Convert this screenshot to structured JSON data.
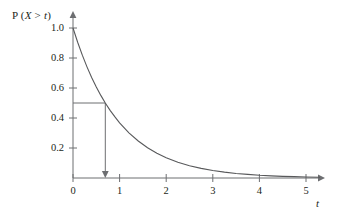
{
  "figure": {
    "background_color": "#ffffff",
    "line_color": "#6d6e71",
    "curve_color": "#58595b",
    "text_color": "#231f20"
  },
  "chart_data": {
    "type": "line",
    "title": "",
    "subtitle": "",
    "xlabel": "t",
    "ylabel": "P (X > t)",
    "xlim": [
      0,
      5.6
    ],
    "ylim": [
      0,
      1.08
    ],
    "grid": false,
    "legend": null,
    "x_ticks": [
      "0",
      "1",
      "2",
      "3",
      "4",
      "5"
    ],
    "x_tick_values": [
      0,
      1,
      2,
      3,
      4,
      5
    ],
    "y_ticks": [
      "0.2",
      "0.4",
      "0.6",
      "0.8",
      "1.0"
    ],
    "y_tick_values": [
      0.2,
      0.4,
      0.6,
      0.8,
      1.0
    ],
    "series": [
      {
        "name": "P(X > t) = e^(-t)",
        "x": [
          0,
          0.1,
          0.2,
          0.3,
          0.4,
          0.5,
          0.6,
          0.693,
          0.8,
          0.9,
          1,
          1.2,
          1.4,
          1.6,
          1.8,
          2,
          2.25,
          2.5,
          2.75,
          3,
          3.25,
          3.5,
          3.75,
          4,
          4.25,
          4.5,
          4.75,
          5,
          5.3
        ],
        "values": [
          1.0,
          0.905,
          0.819,
          0.741,
          0.67,
          0.607,
          0.549,
          0.5,
          0.449,
          0.407,
          0.368,
          0.301,
          0.247,
          0.202,
          0.165,
          0.135,
          0.105,
          0.082,
          0.064,
          0.05,
          0.039,
          0.03,
          0.024,
          0.018,
          0.014,
          0.011,
          0.009,
          0.007,
          0.005
        ]
      }
    ],
    "annotations": [
      {
        "name": "median-guide",
        "description": "horizontal segment at P = 0.5 from y-axis to curve, then vertical segment with downward arrow to t axis",
        "y_value": 0.5,
        "x_value": 0.693
      }
    ]
  },
  "axes": {
    "y_axis_title": "P (X > t)",
    "y_axis_title_parts": {
      "prefix": "P (",
      "variable": "X",
      "relation": " > ",
      "argument": "t",
      "suffix": ")"
    },
    "x_axis_title": "t"
  }
}
